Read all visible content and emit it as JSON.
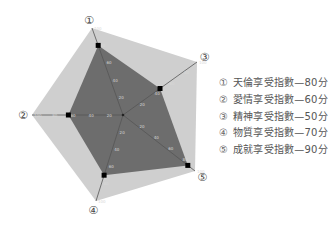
{
  "chart_data": {
    "type": "radar",
    "title": "",
    "center": [
      123,
      115
    ],
    "max": 100,
    "ticks": [
      0,
      20,
      40,
      60,
      80,
      100
    ],
    "axes": [
      {
        "id": "1",
        "marker": "①",
        "label": "天倫享受指數",
        "value": 80,
        "end": [
          92,
          28
        ]
      },
      {
        "id": "3",
        "marker": "③",
        "label": "精神享受指數",
        "value": 50,
        "end": [
          197,
          62
        ]
      },
      {
        "id": "5",
        "marker": "⑤",
        "label": "成就享受指數",
        "value": 90,
        "end": [
          195,
          171
        ]
      },
      {
        "id": "4",
        "marker": "④",
        "label": "物質享受指數",
        "value": 70,
        "end": [
          96,
          201
        ]
      },
      {
        "id": "2",
        "marker": "②",
        "label": "愛情享受指數",
        "value": 60,
        "end": [
          32,
          115
        ]
      }
    ],
    "colors": {
      "outer_fill": "#cfcfcf",
      "data_fill": "#6d6d6d",
      "axis_line": "#555555",
      "point": "#000000"
    }
  },
  "legend": {
    "items": [
      {
        "marker": "①",
        "text": "天倫享受指數—80分"
      },
      {
        "marker": "②",
        "text": "愛情享受指數—60分"
      },
      {
        "marker": "③",
        "text": "精神享受指數—50分"
      },
      {
        "marker": "④",
        "text": "物質享受指數—70分"
      },
      {
        "marker": "⑤",
        "text": "成就享受指數—90分"
      }
    ]
  }
}
